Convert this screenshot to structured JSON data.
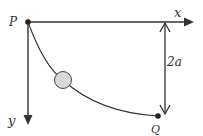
{
  "labels": {
    "p": "P",
    "q": "Q",
    "x": "x",
    "y": "y",
    "height": "2a"
  },
  "colors": {
    "stroke": "#333333",
    "ball_fill": "#d8d8d8"
  }
}
